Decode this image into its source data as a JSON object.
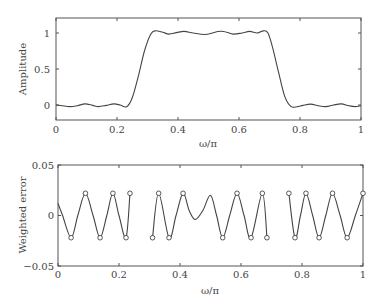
{
  "chart_data": [
    {
      "type": "line",
      "title": "",
      "xlabel": "ω/π",
      "ylabel": "Amplitude",
      "xlim": [
        0,
        1
      ],
      "ylim": [
        -0.2,
        1.2
      ],
      "xticks": [
        "0",
        "0.2",
        "0.4",
        "0.6",
        "0.8",
        "1"
      ],
      "yticks": [
        "0",
        "0.5",
        "1"
      ],
      "grid": false,
      "legend": null,
      "series": [
        {
          "name": "Amplitude response",
          "x": [
            0,
            0.02,
            0.045,
            0.07,
            0.095,
            0.12,
            0.14,
            0.165,
            0.19,
            0.21,
            0.232,
            0.25,
            0.27,
            0.29,
            0.31,
            0.325,
            0.35,
            0.37,
            0.395,
            0.42,
            0.45,
            0.49,
            0.53,
            0.55,
            0.58,
            0.61,
            0.635,
            0.66,
            0.68,
            0.695,
            0.71,
            0.73,
            0.75,
            0.77,
            0.79,
            0.81,
            0.835,
            0.86,
            0.885,
            0.91,
            0.935,
            0.96,
            0.98,
            1.0
          ],
          "values": [
            0,
            -0.01,
            -0.022,
            -0.01,
            0.015,
            -0.005,
            -0.022,
            -0.005,
            0.015,
            0.0,
            -0.025,
            0.1,
            0.4,
            0.75,
            0.98,
            1.03,
            1.01,
            0.985,
            1.005,
            1.022,
            1.0,
            0.98,
            1.02,
            1.022,
            0.985,
            1.0,
            1.022,
            1.0,
            1.03,
            1.0,
            0.8,
            0.45,
            0.12,
            -0.02,
            -0.025,
            -0.005,
            0.012,
            -0.01,
            -0.022,
            0.0,
            0.015,
            -0.01,
            -0.022,
            -0.01
          ]
        }
      ]
    },
    {
      "type": "line",
      "title": "",
      "xlabel": "ω/π",
      "ylabel": "Weighted error",
      "xlim": [
        0,
        1
      ],
      "ylim": [
        -0.05,
        0.05
      ],
      "xticks": [
        "0",
        "0.2",
        "0.4",
        "0.6",
        "0.8",
        "1"
      ],
      "yticks": [
        "-0.05",
        "0",
        "0.05"
      ],
      "grid": false,
      "legend": null,
      "bands": [
        {
          "name": "stopband 1",
          "range": [
            0,
            0.236
          ]
        },
        {
          "name": "passband",
          "range": [
            0.31,
            0.685
          ]
        },
        {
          "name": "stopband 2",
          "range": [
            0.757,
            1.0
          ]
        }
      ],
      "series": [
        {
          "name": "Weighted error",
          "segments": [
            {
              "x": [
                0,
                0.015,
                0.043,
                0.065,
                0.09,
                0.115,
                0.138,
                0.16,
                0.18,
                0.2,
                0.223,
                0.236
              ],
              "values": [
                0.012,
                0.0,
                -0.022,
                0.0,
                0.022,
                0.0,
                -0.022,
                0.0,
                0.022,
                0.0,
                -0.022,
                0.022
              ]
            },
            {
              "x": [
                0.31,
                0.33,
                0.364,
                0.387,
                0.41,
                0.43,
                0.45,
                0.475,
                0.5,
                0.52,
                0.54,
                0.563,
                0.587,
                0.61,
                0.633,
                0.67,
                0.685
              ],
              "values": [
                -0.022,
                0.022,
                -0.022,
                0.0,
                0.022,
                0.005,
                -0.004,
                0.005,
                0.02,
                0.0,
                -0.022,
                0.0,
                0.022,
                0.0,
                -0.022,
                0.022,
                -0.022
              ]
            },
            {
              "x": [
                0.757,
                0.777,
                0.795,
                0.813,
                0.835,
                0.856,
                0.878,
                0.9,
                0.925,
                0.948,
                0.975,
                1.0
              ],
              "values": [
                0.022,
                -0.022,
                0.0,
                0.022,
                0.0,
                -0.022,
                0.0,
                0.022,
                0.0,
                -0.022,
                0.0,
                0.022
              ]
            }
          ]
        },
        {
          "name": "Extremal frequencies",
          "type": "scatter",
          "marker": "circle",
          "x": [
            0.043,
            0.09,
            0.138,
            0.18,
            0.223,
            0.236,
            0.31,
            0.33,
            0.364,
            0.41,
            0.54,
            0.587,
            0.633,
            0.67,
            0.685,
            0.757,
            0.777,
            0.813,
            0.856,
            0.9,
            0.948,
            1.0
          ],
          "values": [
            -0.022,
            0.022,
            -0.022,
            0.022,
            -0.022,
            0.022,
            -0.022,
            0.022,
            -0.022,
            0.022,
            -0.022,
            0.022,
            -0.022,
            0.022,
            -0.022,
            0.022,
            -0.022,
            0.022,
            -0.022,
            0.022,
            -0.022,
            0.022
          ]
        }
      ]
    }
  ]
}
